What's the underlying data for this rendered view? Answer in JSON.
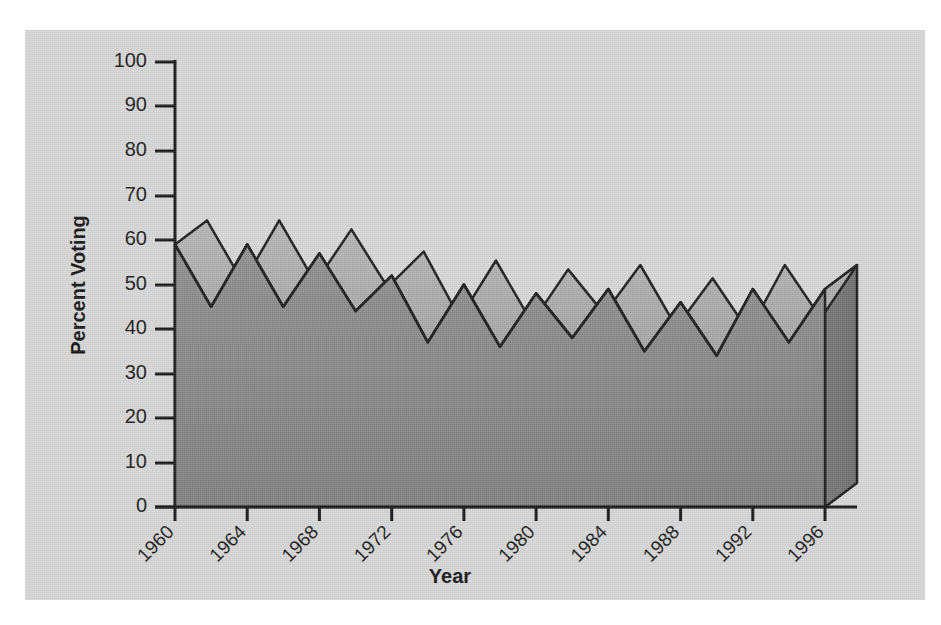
{
  "figure": {
    "background_color": "#ffffff",
    "panel_color": "#d4d4d4"
  },
  "chart_data": {
    "type": "area",
    "title": "",
    "subtitle": "",
    "xlabel": "Year",
    "ylabel": "Percent Voting",
    "x": [
      1960,
      1962,
      1964,
      1966,
      1968,
      1970,
      1972,
      1974,
      1976,
      1978,
      1980,
      1982,
      1984,
      1986,
      1988,
      1990,
      1992,
      1994,
      1996
    ],
    "values": [
      59,
      45,
      59,
      45,
      57,
      44,
      52,
      37,
      50,
      36,
      48,
      38,
      49,
      35,
      46,
      34,
      49,
      37,
      49
    ],
    "categories": [
      "1960",
      "1962",
      "1964",
      "1966",
      "1968",
      "1970",
      "1972",
      "1974",
      "1976",
      "1978",
      "1980",
      "1982",
      "1984",
      "1986",
      "1988",
      "1990",
      "1992",
      "1994",
      "1996"
    ],
    "x_tick_labels": [
      "1960",
      "1964",
      "1968",
      "1972",
      "1976",
      "1980",
      "1984",
      "1988",
      "1992",
      "1996"
    ],
    "x_tick_values": [
      1960,
      1964,
      1968,
      1972,
      1976,
      1980,
      1984,
      1988,
      1992,
      1996
    ],
    "x_tick_rotation": 45,
    "y_tick_labels": [
      "0",
      "10",
      "20",
      "30",
      "40",
      "50",
      "60",
      "70",
      "80",
      "90",
      "100"
    ],
    "y_tick_values": [
      0,
      10,
      20,
      30,
      40,
      50,
      60,
      70,
      80,
      90,
      100
    ],
    "xlim": [
      1960,
      1996
    ],
    "ylim": [
      0,
      100
    ],
    "grid": false,
    "legend": false,
    "legend_position": "none",
    "style": "3d-area",
    "colors": {
      "front_face": "#848484",
      "top_face": "#aaaaaa",
      "side_face": "#6e6e6e",
      "outline": "#1a1a1a",
      "axis": "#141414",
      "text": "#141414"
    }
  },
  "axes": {
    "y_axis_title": "Percent Voting",
    "x_axis_title": "Year"
  }
}
